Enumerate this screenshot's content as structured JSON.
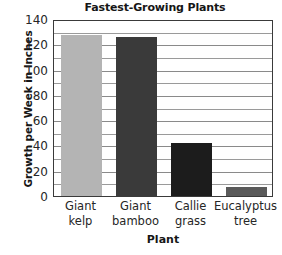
{
  "chart_data": {
    "type": "bar",
    "title": "Fastest-Growing Plants",
    "xlabel": "Plant",
    "ylabel": "Growth per Week in Inches",
    "categories": [
      "Giant kelp",
      "Giant bamboo",
      "Callie grass",
      "Eucalyptus tree"
    ],
    "category_lines": [
      [
        "Giant",
        "kelp"
      ],
      [
        "Giant",
        "bamboo"
      ],
      [
        "Callie",
        "grass"
      ],
      [
        "Eucalyptus",
        "tree"
      ]
    ],
    "values": [
      127,
      126,
      42,
      7
    ],
    "bar_colors": [
      "#b4b4b4",
      "#3a3a3a",
      "#1c1c1c",
      "#5a5a5a"
    ],
    "ylim": [
      0,
      140
    ],
    "ytick_step": 20,
    "yticks": [
      0,
      20,
      40,
      60,
      80,
      100,
      120,
      140
    ],
    "ytick_labels": [
      "0",
      "20",
      "40",
      "60",
      "80",
      "100",
      "120",
      "140"
    ],
    "gridline_step": 10,
    "grid": true,
    "grid_orientation": "horizontal",
    "legend": "none",
    "axis_color": "#3a3a3a",
    "grid_color": "#9a9a9a",
    "background": "#ffffff"
  }
}
